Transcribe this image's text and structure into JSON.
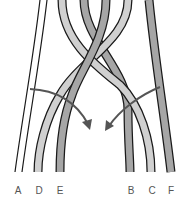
{
  "diagram": {
    "labels": [
      {
        "text": "A",
        "x": 18
      },
      {
        "text": "D",
        "x": 39
      },
      {
        "text": "E",
        "x": 60
      },
      {
        "text": "B",
        "x": 131
      },
      {
        "text": "C",
        "x": 152
      },
      {
        "text": "F",
        "x": 171
      }
    ],
    "colors": {
      "dark_strand": "#a6a6a6",
      "light_strand": "#d0d0d0",
      "outline": "#1a1a1a",
      "arrow": "#555555",
      "label": "#555555"
    }
  }
}
